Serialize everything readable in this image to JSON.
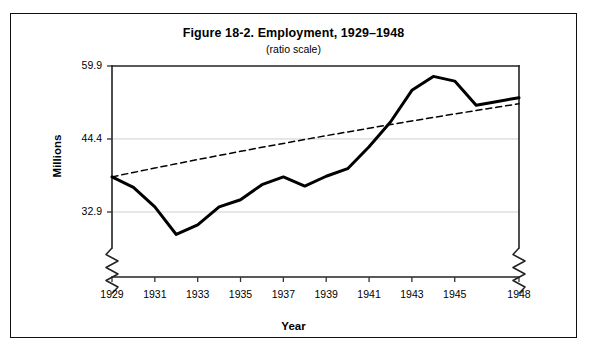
{
  "figure": {
    "title": "Figure 18-2. Employment, 1929–1948",
    "subtitle": "(ratio scale)"
  },
  "axes": {
    "ylabel": "Millions",
    "xlabel": "Year"
  },
  "chart_data": {
    "type": "line",
    "title": "Figure 18-2. Employment, 1929–1948",
    "subtitle": "(ratio scale)",
    "xlabel": "Year",
    "ylabel": "Millions",
    "scale": "ratio (logarithmic) y-axis",
    "grid": "horizontal gridlines at each y tick",
    "legend": "none",
    "axis_break": "zigzag break marks on both left and right vertical axes just above the x-axis (y-axis does not start at zero)",
    "xlim": [
      1929,
      1948
    ],
    "ylim": [
      32.9,
      59.9
    ],
    "yticks": [
      32.9,
      44.4,
      59.9
    ],
    "ytick_labels": [
      "32.9",
      "44.4",
      "59.9"
    ],
    "xticks": [
      1929,
      1931,
      1933,
      1935,
      1937,
      1939,
      1941,
      1943,
      1945,
      1948
    ],
    "xtick_labels": [
      "1929",
      "1931",
      "1933",
      "1935",
      "1937",
      "1939",
      "1941",
      "1943",
      "1945",
      "1948"
    ],
    "x": [
      1929,
      1930,
      1931,
      1932,
      1933,
      1934,
      1935,
      1936,
      1937,
      1938,
      1939,
      1940,
      1941,
      1942,
      1943,
      1944,
      1945,
      1946,
      1947,
      1948
    ],
    "series": [
      {
        "name": "Employment",
        "style": "solid",
        "color": "#000000",
        "values": [
          38.0,
          36.4,
          33.6,
          30.0,
          31.2,
          33.6,
          34.6,
          36.8,
          38.0,
          36.6,
          38.1,
          39.3,
          43.0,
          47.6,
          54.2,
          57.4,
          56.3,
          51.0,
          51.8,
          52.6
        ]
      },
      {
        "name": "Trend",
        "style": "dashed",
        "color": "#000000",
        "values": [
          38.0,
          38.7,
          39.4,
          40.1,
          40.8,
          41.5,
          42.2,
          42.9,
          43.6,
          44.3,
          45.0,
          45.7,
          46.4,
          47.1,
          47.8,
          48.5,
          49.2,
          49.9,
          50.6,
          51.3
        ]
      }
    ]
  }
}
